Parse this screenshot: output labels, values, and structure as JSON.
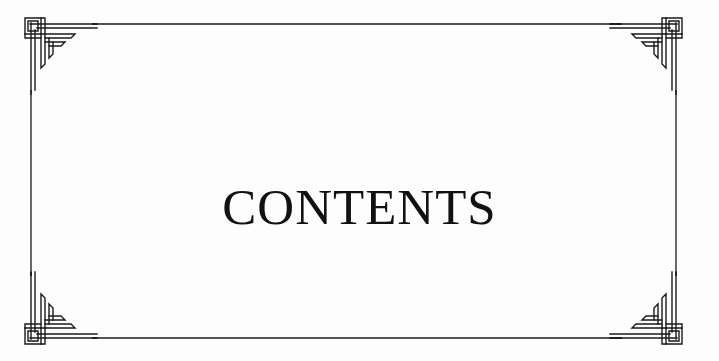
{
  "page": {
    "title": "CONTENTS",
    "background_color": "#ffffff",
    "text_color": "#111111",
    "frame_color": "#1a1a1a"
  },
  "frame": {
    "style": "art-deco double-line border with interlocking corner ornaments",
    "corners": [
      "top-left-ornament",
      "top-right-ornament",
      "bottom-left-ornament",
      "bottom-right-ornament"
    ]
  }
}
